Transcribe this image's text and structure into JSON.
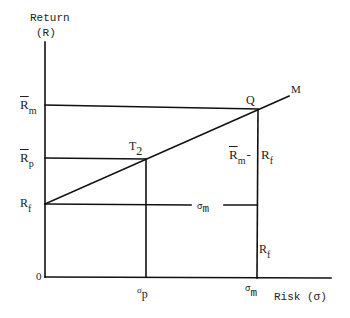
{
  "diagram": {
    "y_axis": {
      "label_line1": "Return",
      "label_line2": "(R)"
    },
    "x_axis": {
      "label": "Risk (σ)"
    },
    "origin_label": "0",
    "y_ticks": [
      {
        "id": "rm",
        "main": "R",
        "sub": "m",
        "overbar": true
      },
      {
        "id": "rp",
        "main": "R",
        "sub": "p",
        "overbar": true
      },
      {
        "id": "rf",
        "main": "R",
        "sub": "f",
        "overbar": false
      }
    ],
    "x_ticks": [
      {
        "id": "sigma_p",
        "main": "σ",
        "sub": "p"
      },
      {
        "id": "sigma_m",
        "main": "σ",
        "sub": "m"
      }
    ],
    "points": {
      "q": "Q",
      "m": "M",
      "t2": {
        "main": "T",
        "sub": "2"
      }
    },
    "annotations": {
      "excess_return": {
        "rm_main": "R",
        "rm_sub": "m",
        "dash": "-",
        "rf_main": "R",
        "rf_sub": "f"
      },
      "sigma_m_span": {
        "main": "σ",
        "sub": "m"
      },
      "rf_vertical": {
        "main": "R",
        "sub": "f"
      }
    },
    "colors": {
      "line": "#111111",
      "text": "#222222",
      "background": "#ffffff"
    }
  }
}
